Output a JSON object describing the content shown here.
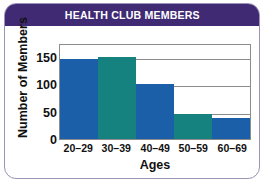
{
  "card": {
    "border_color": "#9b93b5",
    "background": "#ffffff"
  },
  "header": {
    "title": "HEALTH CLUB MEMBERS",
    "background_color": "#3f2a73",
    "text_color": "#ffffff"
  },
  "chart_data": {
    "type": "bar",
    "title": "HEALTH CLUB MEMBERS",
    "xlabel": "Ages",
    "ylabel": "Number of Members",
    "categories": [
      "20–29",
      "30–39",
      "40–49",
      "50–59",
      "60–69"
    ],
    "values": [
      145,
      150,
      100,
      45,
      38
    ],
    "colors": [
      "#1a5fa8",
      "#16827f",
      "#1a5fa8",
      "#16827f",
      "#1a5fa8"
    ],
    "ylim": [
      0,
      175
    ],
    "yticks": [
      0,
      50,
      100,
      150
    ],
    "ytick_labels": [
      "0",
      "50",
      "100",
      "150"
    ],
    "grid": true,
    "gridlines": [
      50,
      100,
      150
    ],
    "legend": null,
    "legend_position": "none",
    "bar_gap": 0,
    "axis_color": "#8c8c8c",
    "text_color": "#111111"
  }
}
